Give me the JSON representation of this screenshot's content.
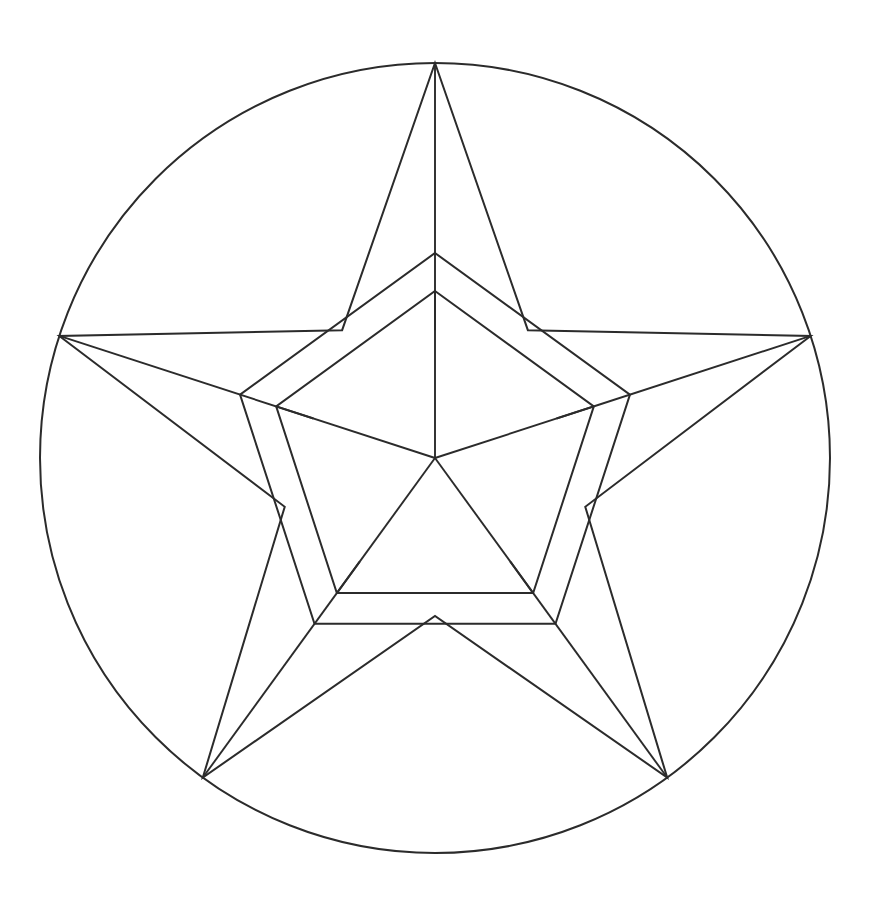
{
  "figure": {
    "background_color": "#ffffff",
    "stroke_color": "#2b2b2b",
    "stroke_width": 2,
    "canvas": {
      "width": 875,
      "height": 906
    }
  },
  "chart_data": {
    "type": "diagram",
    "center": {
      "x": 435,
      "y": 458
    },
    "circle": {
      "cx": 435,
      "cy": 458,
      "r": 395
    },
    "star": {
      "points": 5,
      "outer_radius": 395,
      "inner_radius": 158,
      "start_angle_deg": -90,
      "tips": [
        {
          "label": "top",
          "x": 435,
          "y": 63
        },
        {
          "label": "right",
          "x": 810,
          "y": 336
        },
        {
          "label": "bottom-right",
          "x": 667,
          "y": 777
        },
        {
          "label": "bottom-left",
          "x": 203,
          "y": 777
        },
        {
          "label": "left",
          "x": 60,
          "y": 336
        }
      ],
      "concave_vertices": [
        {
          "x": 527,
          "y": 428
        },
        {
          "x": 528,
          "y": 586
        },
        {
          "x": 435,
          "y": 616
        },
        {
          "x": 342,
          "y": 586
        },
        {
          "x": 343,
          "y": 428
        }
      ],
      "has_point_medians": true
    },
    "pentagon_ring": {
      "outer_circumradius": 205,
      "inner_circumradius": 167,
      "start_angle_deg": -90,
      "outer_vertices": [
        {
          "x": 435,
          "y": 253
        },
        {
          "x": 630,
          "y": 396
        },
        {
          "x": 556,
          "y": 625
        },
        {
          "x": 314,
          "y": 625
        },
        {
          "x": 240,
          "y": 396
        }
      ],
      "inner_vertices": [
        {
          "x": 435,
          "y": 291
        },
        {
          "x": 594,
          "y": 407
        },
        {
          "x": 533,
          "y": 594
        },
        {
          "x": 337,
          "y": 594
        },
        {
          "x": 276,
          "y": 407
        }
      ]
    },
    "center_spokes": {
      "count": 5,
      "from": {
        "x": 435,
        "y": 458
      },
      "to_inner_pentagon_vertices": true
    },
    "counts": {
      "circles": 1,
      "star_points": 5,
      "pentagons": 2,
      "center_spokes": 5,
      "point_medians": 5
    }
  },
  "elements": {
    "circle_label": "outer-circle",
    "star_label": "five-pointed-star",
    "outer_pentagon_label": "outer-pentagon",
    "inner_pentagon_label": "inner-pentagon",
    "spokes_label": "center-spokes",
    "medians_label": "star-point-medians"
  }
}
